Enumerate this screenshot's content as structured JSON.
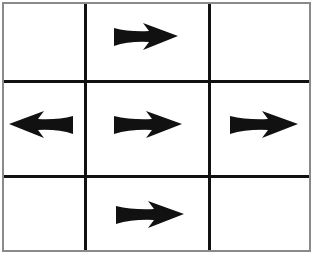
{
  "diagram": {
    "type": "grid",
    "rows": 3,
    "cols": 3,
    "colors": {
      "line": "#111111",
      "border": "#8a8a8a",
      "arrow": "#111111",
      "background": "#ffffff"
    },
    "cells": [
      {
        "row": 0,
        "col": 0,
        "arrow": null
      },
      {
        "row": 0,
        "col": 1,
        "arrow": "right"
      },
      {
        "row": 0,
        "col": 2,
        "arrow": null
      },
      {
        "row": 1,
        "col": 0,
        "arrow": "left"
      },
      {
        "row": 1,
        "col": 1,
        "arrow": "right"
      },
      {
        "row": 1,
        "col": 2,
        "arrow": "right"
      },
      {
        "row": 2,
        "col": 0,
        "arrow": null
      },
      {
        "row": 2,
        "col": 1,
        "arrow": "right"
      },
      {
        "row": 2,
        "col": 2,
        "arrow": null
      }
    ],
    "icons": {
      "right": "arrow-right-icon",
      "left": "arrow-left-icon"
    }
  }
}
